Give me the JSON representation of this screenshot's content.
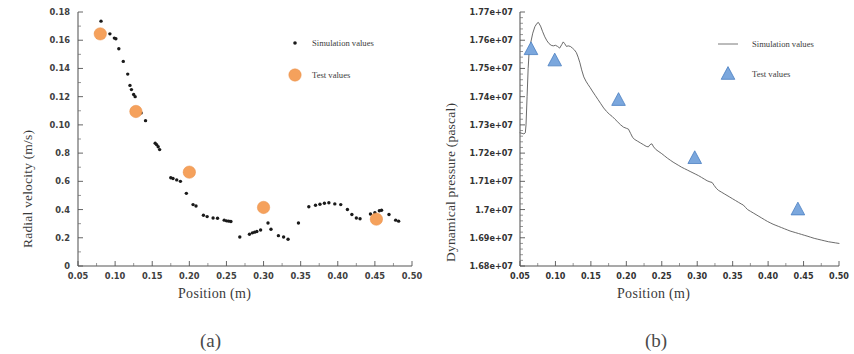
{
  "figure": {
    "panels": [
      {
        "caption": "(a)"
      },
      {
        "caption": "(b)"
      }
    ]
  },
  "panel_a": {
    "ylabel": "Radial velocity (m/s)",
    "xlabel": "Position (m)",
    "caption": "(a)",
    "legend": {
      "simulation": "Simulation values",
      "test": "Test values"
    },
    "colors": {
      "test_marker": "#f5a15c",
      "sim_marker": "#1a1a1a"
    }
  },
  "panel_b": {
    "ylabel": "Dynamical pressure (pascal)",
    "xlabel": "Position (m)",
    "caption": "(b)",
    "legend": {
      "simulation": "Simulation values",
      "test": "Test values"
    },
    "colors": {
      "test_marker": "#7ba7dd",
      "sim_line": "#5a5a5a"
    }
  },
  "chart_data": [
    {
      "type": "scatter",
      "panel": "a",
      "title": "",
      "xlabel": "Position (m)",
      "ylabel": "Radial velocity (m/s)",
      "xlim": [
        0.05,
        0.5
      ],
      "ylim": [
        0,
        0.18
      ],
      "grid": false,
      "legend_position": "top-right",
      "xticks": [
        0.05,
        0.1,
        0.15,
        0.2,
        0.25,
        0.3,
        0.35,
        0.4,
        0.45,
        0.5
      ],
      "xticklabels": [
        "0.05",
        "0.10",
        "0.15",
        "0.20",
        "0.25",
        "0.30",
        "0.35",
        "0.40",
        "0.45",
        "0.50"
      ],
      "yticks": [
        0,
        0.02,
        0.04,
        0.06,
        0.08,
        0.1,
        0.12,
        0.14,
        0.16,
        0.18
      ],
      "yticklabels": [
        "0",
        "0.2",
        "0.4",
        "0.6",
        "0.8",
        "0.10",
        "0.12",
        "0.14",
        "0.16",
        "0.18"
      ],
      "series": [
        {
          "name": "Simulation values",
          "marker": "dot",
          "color": "#1a1a1a",
          "points": [
            [
              0.081,
              0.1735
            ],
            [
              0.093,
              0.1645
            ],
            [
              0.099,
              0.1615
            ],
            [
              0.101,
              0.161
            ],
            [
              0.105,
              0.154
            ],
            [
              0.111,
              0.145
            ],
            [
              0.117,
              0.136
            ],
            [
              0.12,
              0.128
            ],
            [
              0.122,
              0.125
            ],
            [
              0.125,
              0.1215
            ],
            [
              0.127,
              0.12
            ],
            [
              0.13,
              0.1115
            ],
            [
              0.132,
              0.1095
            ],
            [
              0.135,
              0.1085
            ],
            [
              0.141,
              0.103
            ],
            [
              0.154,
              0.087
            ],
            [
              0.156,
              0.086
            ],
            [
              0.158,
              0.0845
            ],
            [
              0.16,
              0.0825
            ],
            [
              0.175,
              0.0625
            ],
            [
              0.178,
              0.062
            ],
            [
              0.183,
              0.061
            ],
            [
              0.188,
              0.06
            ],
            [
              0.196,
              0.0515
            ],
            [
              0.205,
              0.0435
            ],
            [
              0.209,
              0.0425
            ],
            [
              0.219,
              0.036
            ],
            [
              0.224,
              0.035
            ],
            [
              0.232,
              0.034
            ],
            [
              0.238,
              0.0338
            ],
            [
              0.247,
              0.0325
            ],
            [
              0.25,
              0.032
            ],
            [
              0.253,
              0.0318
            ],
            [
              0.256,
              0.0315
            ],
            [
              0.268,
              0.0205
            ],
            [
              0.281,
              0.0225
            ],
            [
              0.285,
              0.0235
            ],
            [
              0.288,
              0.024
            ],
            [
              0.291,
              0.0245
            ],
            [
              0.296,
              0.0255
            ],
            [
              0.306,
              0.0305
            ],
            [
              0.31,
              0.026
            ],
            [
              0.32,
              0.0215
            ],
            [
              0.327,
              0.0205
            ],
            [
              0.333,
              0.019
            ],
            [
              0.347,
              0.0305
            ],
            [
              0.361,
              0.042
            ],
            [
              0.37,
              0.043
            ],
            [
              0.376,
              0.0438
            ],
            [
              0.382,
              0.0445
            ],
            [
              0.388,
              0.0448
            ],
            [
              0.396,
              0.044
            ],
            [
              0.404,
              0.0435
            ],
            [
              0.413,
              0.04
            ],
            [
              0.419,
              0.0365
            ],
            [
              0.425,
              0.034
            ],
            [
              0.43,
              0.0335
            ],
            [
              0.444,
              0.0368
            ],
            [
              0.45,
              0.0378
            ],
            [
              0.456,
              0.0392
            ],
            [
              0.459,
              0.0395
            ],
            [
              0.469,
              0.0365
            ],
            [
              0.478,
              0.0325
            ],
            [
              0.482,
              0.0318
            ]
          ]
        },
        {
          "name": "Test values",
          "marker": "circle",
          "color": "#f5a15c",
          "points": [
            [
              0.08,
              0.1645
            ],
            [
              0.128,
              0.1095
            ],
            [
              0.2,
              0.0665
            ],
            [
              0.3,
              0.0415
            ],
            [
              0.452,
              0.0332
            ]
          ]
        }
      ]
    },
    {
      "type": "line",
      "panel": "b",
      "title": "",
      "xlabel": "Position (m)",
      "ylabel": "Dynamical pressure (pascal)",
      "xlim": [
        0.05,
        0.5
      ],
      "ylim": [
        16800000,
        17700000
      ],
      "grid": false,
      "legend_position": "top-right",
      "xticks": [
        0.05,
        0.1,
        0.15,
        0.2,
        0.25,
        0.3,
        0.35,
        0.4,
        0.45,
        0.5
      ],
      "xticklabels": [
        "0.05",
        "0.10",
        "0.15",
        "0.20",
        "0.25",
        "0.30",
        "0.35",
        "0.40",
        "0.45",
        "0.50"
      ],
      "yticks": [
        16800000,
        16900000,
        17000000,
        17100000,
        17200000,
        17300000,
        17400000,
        17500000,
        17600000,
        17700000
      ],
      "yticklabels": [
        "1.68e+07",
        "1.69e+07",
        "1.7e+07",
        "1.71e+07",
        "1.72e+07",
        "1.73e+07",
        "1.74e+07",
        "1.75e+07",
        "1.76e+07",
        "1.77e+07"
      ],
      "series": [
        {
          "name": "Simulation values",
          "marker": "line",
          "color": "#5a5a5a",
          "points": [
            [
              0.05,
              17272000
            ],
            [
              0.053,
              17270000
            ],
            [
              0.0555,
              17268000
            ],
            [
              0.0575,
              17272000
            ],
            [
              0.0585,
              17300000
            ],
            [
              0.06,
              17400000
            ],
            [
              0.0615,
              17500000
            ],
            [
              0.063,
              17565000
            ],
            [
              0.065,
              17590000
            ],
            [
              0.068,
              17625000
            ],
            [
              0.071,
              17648000
            ],
            [
              0.074,
              17660000
            ],
            [
              0.076,
              17663000
            ],
            [
              0.079,
              17650000
            ],
            [
              0.082,
              17630000
            ],
            [
              0.085,
              17612000
            ],
            [
              0.088,
              17598000
            ],
            [
              0.091,
              17588000
            ],
            [
              0.094,
              17582000
            ],
            [
              0.097,
              17580000
            ],
            [
              0.1,
              17582000
            ],
            [
              0.103,
              17578000
            ],
            [
              0.106,
              17572000
            ],
            [
              0.109,
              17585000
            ],
            [
              0.111,
              17594000
            ],
            [
              0.113,
              17588000
            ],
            [
              0.1155,
              17578000
            ],
            [
              0.118,
              17580000
            ],
            [
              0.121,
              17578000
            ],
            [
              0.124,
              17572000
            ],
            [
              0.127,
              17565000
            ],
            [
              0.1295,
              17556000
            ],
            [
              0.132,
              17540000
            ],
            [
              0.1345,
              17520000
            ],
            [
              0.137,
              17495000
            ],
            [
              0.14,
              17470000
            ],
            [
              0.143,
              17455000
            ],
            [
              0.146,
              17443000
            ],
            [
              0.149,
              17432000
            ],
            [
              0.152,
              17420000
            ],
            [
              0.156,
              17405000
            ],
            [
              0.16,
              17390000
            ],
            [
              0.164,
              17375000
            ],
            [
              0.168,
              17360000
            ],
            [
              0.172,
              17348000
            ],
            [
              0.176,
              17338000
            ],
            [
              0.18,
              17330000
            ],
            [
              0.184,
              17320000
            ],
            [
              0.188,
              17310000
            ],
            [
              0.192,
              17300000
            ],
            [
              0.196,
              17292000
            ],
            [
              0.2,
              17288000
            ],
            [
              0.203,
              17285000
            ],
            [
              0.206,
              17270000
            ],
            [
              0.209,
              17255000
            ],
            [
              0.212,
              17248000
            ],
            [
              0.216,
              17242000
            ],
            [
              0.22,
              17236000
            ],
            [
              0.224,
              17230000
            ],
            [
              0.228,
              17224000
            ],
            [
              0.231,
              17222000
            ],
            [
              0.2335,
              17230000
            ],
            [
              0.236,
              17233000
            ],
            [
              0.2385,
              17222000
            ],
            [
              0.242,
              17212000
            ],
            [
              0.246,
              17205000
            ],
            [
              0.25,
              17198000
            ],
            [
              0.254,
              17190000
            ],
            [
              0.258,
              17182000
            ],
            [
              0.262,
              17175000
            ],
            [
              0.266,
              17168000
            ],
            [
              0.27,
              17162000
            ],
            [
              0.274,
              17156000
            ],
            [
              0.278,
              17150000
            ],
            [
              0.282,
              17145000
            ],
            [
              0.286,
              17140000
            ],
            [
              0.29,
              17135000
            ],
            [
              0.294,
              17130000
            ],
            [
              0.298,
              17125000
            ],
            [
              0.302,
              17120000
            ],
            [
              0.306,
              17114000
            ],
            [
              0.31,
              17108000
            ],
            [
              0.314,
              17102000
            ],
            [
              0.318,
              17098000
            ],
            [
              0.321,
              17096000
            ],
            [
              0.324,
              17085000
            ],
            [
              0.327,
              17075000
            ],
            [
              0.33,
              17068000
            ],
            [
              0.334,
              17062000
            ],
            [
              0.338,
              17056000
            ],
            [
              0.342,
              17050000
            ],
            [
              0.346,
              17044000
            ],
            [
              0.35,
              17038000
            ],
            [
              0.354,
              17032000
            ],
            [
              0.358,
              17026000
            ],
            [
              0.362,
              17020000
            ],
            [
              0.365,
              17016000
            ],
            [
              0.368,
              17008000
            ],
            [
              0.371,
              17000000
            ],
            [
              0.375,
              16994000
            ],
            [
              0.379,
              16988000
            ],
            [
              0.383,
              16982000
            ],
            [
              0.387,
              16976000
            ],
            [
              0.391,
              16970000
            ],
            [
              0.395,
              16964000
            ],
            [
              0.399,
              16958000
            ],
            [
              0.403,
              16953000
            ],
            [
              0.407,
              16948000
            ],
            [
              0.411,
              16944000
            ],
            [
              0.415,
              16940000
            ],
            [
              0.419,
              16936000
            ],
            [
              0.423,
              16932000
            ],
            [
              0.427,
              16928000
            ],
            [
              0.431,
              16924000
            ],
            [
              0.435,
              16921000
            ],
            [
              0.439,
              16918000
            ],
            [
              0.443,
              16915000
            ],
            [
              0.447,
              16912000
            ],
            [
              0.451,
              16909000
            ],
            [
              0.455,
              16906000
            ],
            [
              0.46,
              16902000
            ],
            [
              0.465,
              16898000
            ],
            [
              0.47,
              16895000
            ],
            [
              0.475,
              16892000
            ],
            [
              0.48,
              16889000
            ],
            [
              0.485,
              16886000
            ],
            [
              0.49,
              16884000
            ],
            [
              0.495,
              16882000
            ],
            [
              0.5,
              16880000
            ]
          ]
        },
        {
          "name": "Test values",
          "marker": "triangle",
          "color": "#7ba7dd",
          "points": [
            [
              0.0655,
              17568000
            ],
            [
              0.099,
              17528000
            ],
            [
              0.189,
              17388000
            ],
            [
              0.2965,
              17182000
            ],
            [
              0.442,
              17000000
            ]
          ]
        }
      ]
    }
  ]
}
